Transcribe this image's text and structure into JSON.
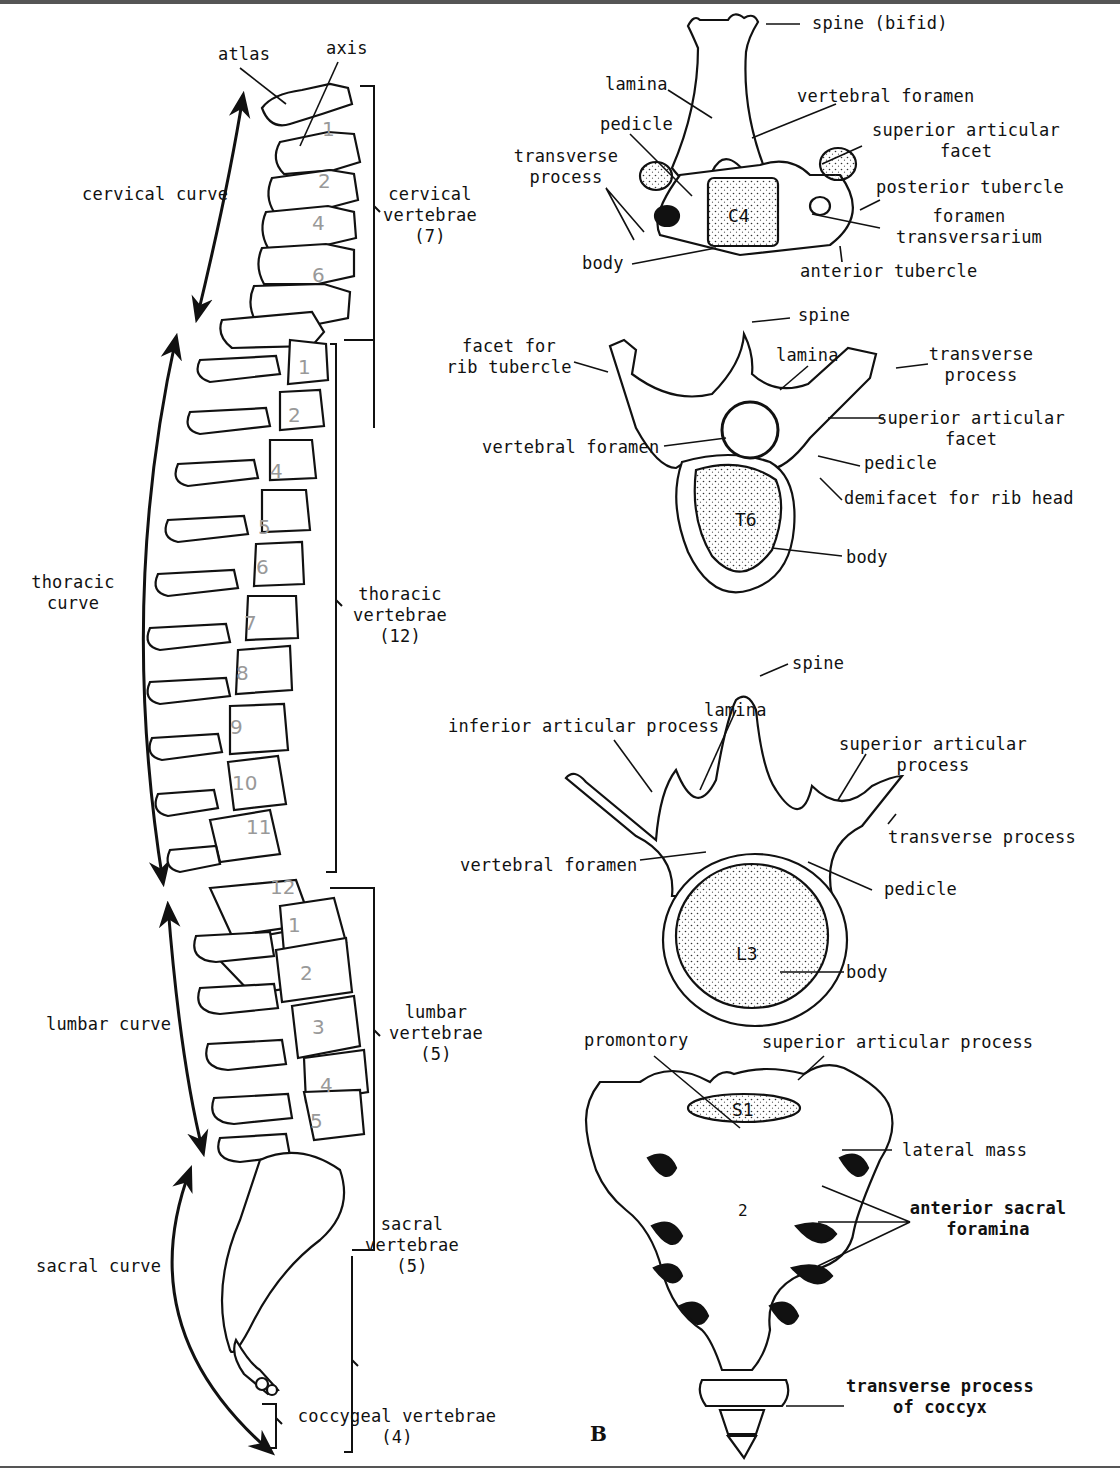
{
  "figure": {
    "panel_letter": "B",
    "lateral_view": {
      "labels": {
        "atlas": "atlas",
        "axis": "axis",
        "cervical_curve": "cervical curve",
        "thoracic_curve_1": "thoracic",
        "thoracic_curve_2": "curve",
        "lumbar_curve": "lumbar curve",
        "sacral_curve": "sacral curve"
      },
      "groups": [
        {
          "name": "cervical",
          "line1": "cervical",
          "line2": "vertebrae",
          "count": "(7)"
        },
        {
          "name": "thoracic",
          "line1": "thoracic",
          "line2": "vertebrae",
          "count": "(12)"
        },
        {
          "name": "lumbar",
          "line1": "lumbar",
          "line2": "vertebrae",
          "count": "(5)"
        },
        {
          "name": "sacral",
          "line1": "sacral",
          "line2": "vertebrae",
          "count": "(5)"
        },
        {
          "name": "coccygeal",
          "line1": "coccygeal vertebrae",
          "line2": "",
          "count": "(4)"
        }
      ],
      "handwritten_numbers": {
        "cervical": [
          "1",
          "2",
          "3",
          "4",
          "5",
          "6",
          "7"
        ],
        "thoracic": [
          "1",
          "2",
          "3",
          "4",
          "5",
          "6",
          "7",
          "8",
          "9",
          "10",
          "11",
          "12"
        ],
        "lumbar": [
          "1",
          "2",
          "3",
          "4",
          "5"
        ]
      }
    },
    "cervical_c4": {
      "body_label": "C4",
      "labels": {
        "spine": "spine (bifid)",
        "lamina": "lamina",
        "vertebral_foramen": "vertebral foramen",
        "pedicle": "pedicle",
        "transverse_process_1": "transverse",
        "transverse_process_2": "process",
        "superior_facet_1": "superior articular",
        "superior_facet_2": "facet",
        "posterior_tubercle": "posterior tubercle",
        "foramen_transversarium_1": "foramen",
        "foramen_transversarium_2": "transversarium",
        "body": "body",
        "anterior_tubercle": "anterior tubercle"
      }
    },
    "thoracic_t6": {
      "body_label": "T6",
      "labels": {
        "spine": "spine",
        "facet_rib_tubercle_1": "facet for",
        "facet_rib_tubercle_2": "rib tubercle",
        "lamina": "lamina",
        "transverse_process_1": "transverse",
        "transverse_process_2": "process",
        "superior_facet_1": "superior articular",
        "superior_facet_2": "facet",
        "vertebral_foramen": "vertebral foramen",
        "pedicle": "pedicle",
        "demifacet": "demifacet for rib head",
        "body": "body"
      }
    },
    "lumbar_l3": {
      "body_label": "L3",
      "labels": {
        "spine": "spine",
        "lamina": "lamina",
        "inferior_articular_process": "inferior articular process",
        "superior_articular_process_1": "superior articular",
        "superior_articular_process_2": "process",
        "transverse_process": "transverse process",
        "vertebral_foramen": "vertebral foramen",
        "pedicle": "pedicle",
        "body": "body"
      }
    },
    "sacrum": {
      "s1_label": "S1",
      "s2_label": "2",
      "labels": {
        "promontory": "promontory",
        "superior_articular_process": "superior articular process",
        "lateral_mass": "lateral mass",
        "anterior_sacral_foramina_1": "anterior sacral",
        "anterior_sacral_foramina_2": "foramina",
        "transverse_process_coccyx_1": "transverse process",
        "transverse_process_coccyx_2": "of coccyx"
      }
    }
  }
}
